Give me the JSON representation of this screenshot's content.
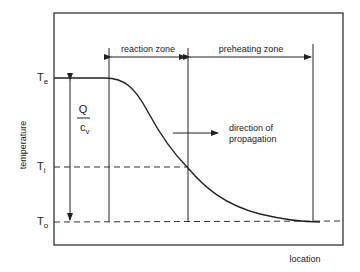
{
  "diagram": {
    "type": "temperature-profile",
    "y_axis_label": "temperature",
    "x_axis_label": "location",
    "levels": {
      "Te": {
        "symbol": "T",
        "subscript": "e"
      },
      "Ti": {
        "symbol": "T",
        "subscript": "i"
      },
      "To": {
        "symbol": "T",
        "subscript": "o"
      }
    },
    "heat_release": {
      "numerator": "Q",
      "denominator": "c",
      "denominator_sub": "v"
    },
    "zones": [
      {
        "label": "reaction zone"
      },
      {
        "label": "preheating zone"
      }
    ],
    "propagation_label_line1": "direction of",
    "propagation_label_line2": "propagation"
  }
}
